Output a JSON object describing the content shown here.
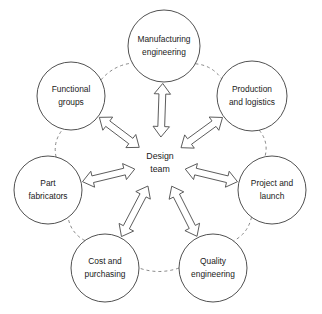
{
  "diagram": {
    "type": "hub-and-spoke",
    "hub": {
      "id": "design-team",
      "label_line1": "Design",
      "label_line2": "team",
      "center_x": 160,
      "center_y": 163
    },
    "colors": {
      "background": "#ffffff",
      "circle_stroke": "#3d3d3d",
      "ring_link_stroke": "#7a7a7a",
      "arrow_stroke": "#4a4a4a",
      "text": "#1a1a1a"
    },
    "nodes": [
      {
        "id": "manufacturing-engineering",
        "label_line1": "Manufacturing",
        "label_line2": "engineering",
        "cx": 164,
        "cy": 46,
        "r": 36,
        "angle_deg": 90
      },
      {
        "id": "production-and-logistics",
        "label_line1": "Production",
        "label_line2": "and logistics",
        "cx": 252,
        "cy": 96,
        "r": 35,
        "angle_deg": 38
      },
      {
        "id": "project-and-launch",
        "label_line1": "Project and",
        "label_line2": "launch",
        "cx": 272,
        "cy": 190,
        "r": 34,
        "angle_deg": -13
      },
      {
        "id": "quality-engineering",
        "label_line1": "Quality",
        "label_line2": "engineering",
        "cx": 213,
        "cy": 268,
        "r": 34,
        "angle_deg": -63
      },
      {
        "id": "cost-and-purchasing",
        "label_line1": "Cost and",
        "label_line2": "purchasing",
        "cx": 105,
        "cy": 268,
        "r": 34,
        "angle_deg": -117
      },
      {
        "id": "part-fabricators",
        "label_line1": "Part",
        "label_line2": "fabricators",
        "cx": 48,
        "cy": 190,
        "r": 34,
        "angle_deg": 193
      },
      {
        "id": "functional-groups",
        "label_line1": "Functional",
        "label_line2": "groups",
        "cx": 71,
        "cy": 96,
        "r": 34,
        "angle_deg": 142
      }
    ],
    "ring_links": [
      {
        "from": "functional-groups",
        "to": "manufacturing-engineering"
      },
      {
        "from": "manufacturing-engineering",
        "to": "production-and-logistics"
      },
      {
        "from": "production-and-logistics",
        "to": "project-and-launch"
      },
      {
        "from": "project-and-launch",
        "to": "quality-engineering"
      },
      {
        "from": "quality-engineering",
        "to": "cost-and-purchasing"
      },
      {
        "from": "cost-and-purchasing",
        "to": "part-fabricators"
      },
      {
        "from": "part-fabricators",
        "to": "functional-groups"
      }
    ],
    "spokes": [
      {
        "to": "manufacturing-engineering",
        "style": "double-headed-hollow-arrow"
      },
      {
        "to": "production-and-logistics",
        "style": "double-headed-hollow-arrow"
      },
      {
        "to": "project-and-launch",
        "style": "double-headed-hollow-arrow"
      },
      {
        "to": "quality-engineering",
        "style": "double-headed-hollow-arrow"
      },
      {
        "to": "cost-and-purchasing",
        "style": "double-headed-hollow-arrow"
      },
      {
        "to": "part-fabricators",
        "style": "double-headed-hollow-arrow"
      },
      {
        "to": "functional-groups",
        "style": "double-headed-hollow-arrow"
      }
    ]
  }
}
